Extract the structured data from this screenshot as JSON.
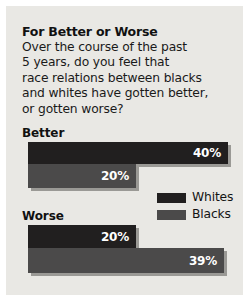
{
  "panel": {
    "background_color": "#e9e8e4",
    "border_color": "#ffffff"
  },
  "title": "For Better or Worse",
  "question_lines": [
    "Over the course of the past",
    "5 years, do you feel that",
    "race relations between blacks",
    "and whites have gotten better,",
    "or gotten worse?"
  ],
  "groups": [
    {
      "label": "Better"
    },
    {
      "label": "Worse"
    }
  ],
  "legend": {
    "items": [
      {
        "label": "Whites",
        "color": "#211f1f",
        "swatch_name": "legend-swatch-whites"
      },
      {
        "label": "Blacks",
        "color": "#4b4a4a",
        "swatch_name": "legend-swatch-blacks"
      }
    ]
  },
  "bars": {
    "better_whites": "40%",
    "better_blacks": "20%",
    "worse_whites": "20%",
    "worse_blacks": "39%"
  },
  "chart_data": {
    "type": "bar",
    "title": "For Better or Worse",
    "subtitle": "Over the course of the past 5 years, do you feel that race relations between blacks and whites have gotten better, or gotten worse?",
    "orientation": "horizontal",
    "categories": [
      "Better",
      "Worse"
    ],
    "series": [
      {
        "name": "Whites",
        "values": [
          40,
          20
        ],
        "color": "#211f1f",
        "labels": [
          "40%",
          "20%"
        ]
      },
      {
        "name": "Blacks",
        "values": [
          20,
          39
        ],
        "color": "#4b4a4a",
        "labels": [
          "20%",
          "39%"
        ]
      }
    ],
    "unit": "percent",
    "xlabel": "",
    "ylabel": "",
    "xlim": [
      0,
      48
    ],
    "grid": false,
    "legend_position": "middle-right",
    "data_labels": true
  }
}
